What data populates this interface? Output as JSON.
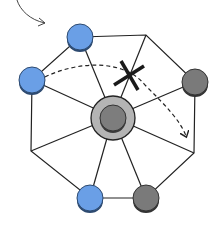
{
  "diagram": {
    "colors": {
      "background": "#ffffff",
      "line": "#222222",
      "blue_piece": "#6a9fe6",
      "blue_piece_edge": "#2d4a70",
      "gray_piece": "#7a7a7a",
      "gray_piece_edge": "#333333",
      "center_ring": "#b4b4b4",
      "center_piece": "#7d7d7d",
      "cross": "#1a1a1a"
    },
    "center": {
      "x": 113,
      "y": 117,
      "ring_r": 22,
      "piece_r": 13
    },
    "vertices": [
      {
        "id": "top-left",
        "x": 80,
        "y": 37,
        "piece": "blue"
      },
      {
        "id": "top-right",
        "x": 146,
        "y": 35,
        "piece": null
      },
      {
        "id": "right-upper",
        "x": 195,
        "y": 82,
        "piece": "gray"
      },
      {
        "id": "right-lower",
        "x": 194,
        "y": 153,
        "piece": null
      },
      {
        "id": "bottom-right",
        "x": 146,
        "y": 198,
        "piece": "gray"
      },
      {
        "id": "bottom-left",
        "x": 90,
        "y": 198,
        "piece": "blue"
      },
      {
        "id": "left-lower",
        "x": 31,
        "y": 151,
        "piece": null
      },
      {
        "id": "left-upper",
        "x": 32,
        "y": 80,
        "piece": "blue"
      }
    ],
    "annotations": {
      "pointer_arrow": "curved arrow pointing to top-left piece",
      "dashed_move": "dashed arc from left-upper piece toward right-lower vertex",
      "blocked_mark": "X"
    }
  }
}
